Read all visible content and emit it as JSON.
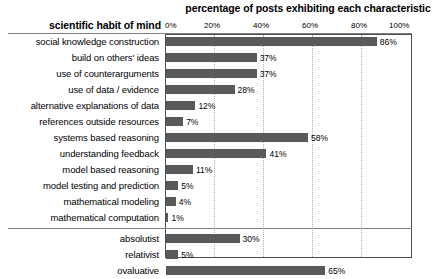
{
  "chart_data": {
    "type": "bar",
    "orientation": "horizontal",
    "title": "percentage of posts exhibiting each characteristic",
    "category_axis_title": "scientific habit of mind",
    "xlabel": "",
    "ylabel": "",
    "xlim": [
      0,
      100
    ],
    "xticks": [
      0,
      20,
      40,
      60,
      80,
      100
    ],
    "xtick_labels": [
      "0%",
      "20%",
      "40%",
      "60%",
      "80%",
      "100%"
    ],
    "grid": true,
    "legend": "none",
    "bar_color": "#595959",
    "categories": [
      "social knowledge construction",
      "build on others' ideas",
      "use of counterarguments",
      "use of data / evidence",
      "alternative explanations of data",
      "references outside resources",
      "systems based reasoning",
      "understanding feedback",
      "model based reasoning",
      "model testing and prediction",
      "mathematical modeling",
      "mathematical computation",
      "absolutist",
      "relativist",
      "ovaluative"
    ],
    "values": [
      86,
      37,
      37,
      28,
      12,
      7,
      58,
      41,
      11,
      5,
      4,
      1,
      30,
      5,
      65
    ],
    "value_labels": [
      "86%",
      "37%",
      "37%",
      "28%",
      "12%",
      "7%",
      "58%",
      "41%",
      "11%",
      "5%",
      "4%",
      "1%",
      "30%",
      "5%",
      "65%"
    ],
    "groups": [
      {
        "name": "scientific habit of mind",
        "start_index": 0,
        "end_index": 11
      },
      {
        "name": "epistemological stance",
        "start_index": 12,
        "end_index": 14
      }
    ],
    "group_separator_after_index": 11
  }
}
